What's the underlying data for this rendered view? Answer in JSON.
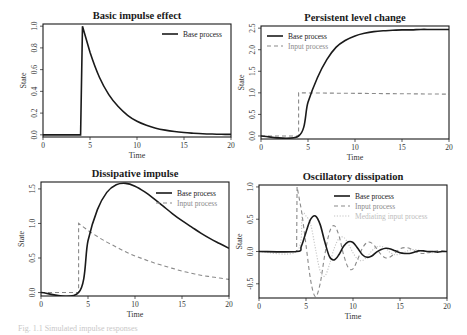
{
  "figure": {
    "caption": "Fig. 1.1  Simulated impulse responses"
  },
  "colors": {
    "base": "#1a1a1a",
    "input": "#8a8a8a",
    "mediating": "#c4c4c4",
    "axis": "#1a1a1a",
    "legend_input_text": "#8a8a8a",
    "legend_mediating_text": "#bdbdbd"
  },
  "chart_data": [
    {
      "id": "p1",
      "type": "line",
      "title": "Basic impulse effect",
      "xlabel": "Time",
      "ylabel": "State",
      "xlim": [
        0,
        20
      ],
      "ylim": [
        -0.02,
        1.02
      ],
      "xticks": [
        0,
        5,
        10,
        15,
        20
      ],
      "yticks": [
        0.0,
        0.2,
        0.4,
        0.6,
        0.8,
        1.0
      ],
      "ytick_labels": [
        "0.0",
        "0.2",
        "0.4",
        "0.6",
        "0.8",
        "1.0"
      ],
      "legend": [
        {
          "label": "Base process",
          "style": "solid",
          "color": "#1a1a1a"
        }
      ],
      "legend_position": "top-right",
      "grid": false,
      "series": [
        {
          "name": "Base process",
          "style": "solid",
          "x": [
            0,
            4,
            4,
            4.2,
            5,
            6,
            7,
            8,
            9,
            10,
            11,
            12,
            13,
            14,
            15,
            16,
            17,
            18,
            19,
            20
          ],
          "values": [
            0,
            0,
            0,
            1.0,
            0.76,
            0.53,
            0.37,
            0.26,
            0.18,
            0.125,
            0.088,
            0.061,
            0.043,
            0.03,
            0.021,
            0.015,
            0.01,
            0.007,
            0.005,
            0.004
          ]
        }
      ]
    },
    {
      "id": "p2",
      "type": "line",
      "title": "Persistent level change",
      "xlabel": "Time",
      "ylabel": "State",
      "xlim": [
        0,
        20
      ],
      "ylim": [
        -0.07,
        2.55
      ],
      "xticks": [
        0,
        5,
        10,
        15,
        20
      ],
      "yticks": [
        0.0,
        0.5,
        1.0,
        1.5,
        2.0,
        2.5
      ],
      "ytick_labels": [
        "0.0",
        "0.5",
        "1.0",
        "1.5",
        "2.0",
        "2.5"
      ],
      "legend": [
        {
          "label": "Base process",
          "style": "solid",
          "color": "#1a1a1a"
        },
        {
          "label": "Input process",
          "style": "dashed",
          "color": "#8a8a8a"
        }
      ],
      "legend_position": "top-left",
      "grid": false,
      "series": [
        {
          "name": "Base process",
          "style": "solid",
          "x": [
            0,
            4,
            5,
            6,
            7,
            8,
            9,
            10,
            11,
            12,
            13,
            14,
            15,
            16,
            17,
            18,
            19,
            20
          ],
          "values": [
            0,
            0,
            0.78,
            1.35,
            1.77,
            2.06,
            2.22,
            2.32,
            2.38,
            2.42,
            2.44,
            2.45,
            2.46,
            2.46,
            2.47,
            2.47,
            2.47,
            2.47
          ]
        },
        {
          "name": "Input process",
          "style": "dashed",
          "x": [
            0,
            4,
            4,
            20
          ],
          "values": [
            0,
            0,
            1.0,
            0.97
          ]
        }
      ]
    },
    {
      "id": "p3",
      "type": "line",
      "title": "Dissipative impulse",
      "xlabel": "Time",
      "ylabel": "State",
      "xlim": [
        0,
        20
      ],
      "ylim": [
        -0.05,
        1.6
      ],
      "xticks": [
        0,
        5,
        10,
        15,
        20
      ],
      "yticks": [
        0.0,
        0.5,
        1.0,
        1.5
      ],
      "ytick_labels": [
        "0.0",
        "0.5",
        "1.0",
        "1.5"
      ],
      "legend": [
        {
          "label": "Base process",
          "style": "solid",
          "color": "#1a1a1a"
        },
        {
          "label": "Input process",
          "style": "dashed",
          "color": "#8a8a8a"
        }
      ],
      "legend_position": "top-right",
      "grid": false,
      "series": [
        {
          "name": "Base process",
          "style": "solid",
          "x": [
            0,
            4,
            5,
            6,
            7,
            8,
            9,
            10,
            11,
            12,
            13,
            14,
            15,
            16,
            17,
            18,
            19,
            20
          ],
          "values": [
            0,
            0,
            0.75,
            1.2,
            1.45,
            1.56,
            1.58,
            1.54,
            1.46,
            1.36,
            1.25,
            1.14,
            1.04,
            0.95,
            0.86,
            0.78,
            0.71,
            0.64
          ]
        },
        {
          "name": "Input process",
          "style": "dashed",
          "x": [
            0,
            4,
            4,
            5,
            6,
            7,
            8,
            9,
            10,
            11,
            12,
            13,
            14,
            15,
            16,
            17,
            18,
            19,
            20
          ],
          "values": [
            0,
            0,
            1.0,
            0.9,
            0.81,
            0.73,
            0.66,
            0.59,
            0.53,
            0.48,
            0.43,
            0.39,
            0.35,
            0.31,
            0.28,
            0.25,
            0.23,
            0.21,
            0.19
          ]
        }
      ]
    },
    {
      "id": "p4",
      "type": "line",
      "title": "Oscillatory dissipation",
      "xlabel": "Time",
      "ylabel": "State",
      "xlim": [
        0,
        20
      ],
      "ylim": [
        -0.72,
        1.03
      ],
      "xticks": [
        0,
        5,
        10,
        15,
        20
      ],
      "yticks": [
        -0.5,
        0.0,
        0.5,
        1.0
      ],
      "ytick_labels": [
        "-0.5",
        "0.0",
        "0.5",
        "1.0"
      ],
      "legend": [
        {
          "label": "Base process",
          "style": "solid",
          "color": "#1a1a1a"
        },
        {
          "label": "Input process",
          "style": "dashed",
          "color": "#8a8a8a"
        },
        {
          "label": "Mediating input process",
          "style": "dotted",
          "color": "#c4c4c4"
        }
      ],
      "legend_position": "top-right",
      "grid": false,
      "series": [
        {
          "name": "Base process",
          "style": "solid",
          "x": [
            0,
            4,
            4.5,
            5,
            5.5,
            6,
            6.5,
            7,
            7.5,
            8,
            8.5,
            9,
            9.5,
            10,
            10.5,
            11,
            11.5,
            12,
            12.5,
            13,
            13.5,
            14,
            14.5,
            15,
            15.5,
            16,
            16.5,
            17,
            17.5,
            18,
            18.5,
            19,
            19.5,
            20
          ],
          "values": [
            0,
            0,
            0.08,
            0.3,
            0.5,
            0.55,
            0.42,
            0.15,
            -0.08,
            -0.13,
            -0.05,
            0.08,
            0.15,
            0.14,
            0.05,
            -0.05,
            -0.09,
            -0.07,
            -0.01,
            0.03,
            0.05,
            0.04,
            0.01,
            -0.02,
            -0.03,
            -0.03,
            -0.01,
            0.01,
            0.01,
            0.0,
            0.0,
            -0.01,
            0.0,
            0.0
          ]
        },
        {
          "name": "Input process",
          "style": "dashed",
          "x": [
            0,
            4,
            4.05,
            4.5,
            5,
            5.5,
            6,
            6.5,
            7,
            7.5,
            8,
            8.5,
            9,
            9.5,
            10,
            10.5,
            11,
            11.5,
            12,
            12.5,
            13,
            13.5,
            14,
            14.5,
            15,
            15.5,
            16,
            16.5,
            17,
            17.5,
            18,
            18.5,
            19,
            19.5,
            20
          ],
          "values": [
            0,
            0,
            1.0,
            0.65,
            0.1,
            -0.45,
            -0.7,
            -0.5,
            -0.05,
            0.3,
            0.4,
            0.25,
            -0.05,
            -0.25,
            -0.27,
            -0.12,
            0.05,
            0.14,
            0.13,
            0.05,
            -0.05,
            -0.1,
            -0.08,
            -0.02,
            0.04,
            0.06,
            0.05,
            0.01,
            -0.02,
            -0.03,
            -0.02,
            0.0,
            0.01,
            0.01,
            0.0
          ]
        },
        {
          "name": "Mediating input process",
          "style": "dotted",
          "x": [
            0,
            4,
            4.6,
            5,
            5.5,
            6,
            6.5,
            7,
            7.5,
            8,
            8.5,
            9,
            9.5,
            10,
            10.5,
            11,
            11.5,
            12,
            12.5,
            13,
            13.5,
            14,
            14.5,
            15,
            15.5,
            16,
            16.5,
            17,
            17.5,
            18,
            18.5,
            19,
            19.5,
            20
          ],
          "values": [
            0,
            0,
            0.55,
            0.55,
            0.42,
            0.05,
            -0.3,
            -0.38,
            -0.2,
            0.05,
            0.2,
            0.22,
            0.12,
            -0.02,
            -0.12,
            -0.14,
            -0.08,
            0.01,
            0.07,
            0.08,
            0.04,
            -0.02,
            -0.05,
            -0.04,
            -0.01,
            0.02,
            0.03,
            0.02,
            0.0,
            -0.01,
            -0.02,
            -0.01,
            0.0,
            0.0
          ]
        }
      ]
    }
  ]
}
